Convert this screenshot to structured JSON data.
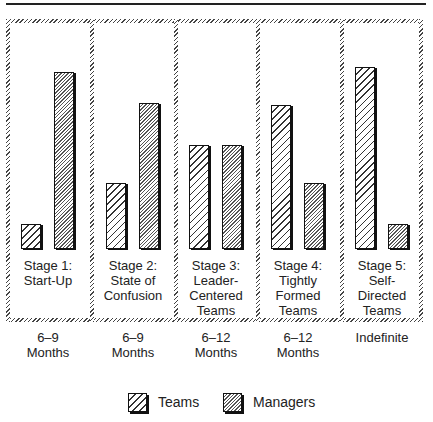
{
  "chart_data": {
    "type": "bar",
    "title": "",
    "xlabel": "",
    "ylabel": "",
    "ylim": [
      0,
      100
    ],
    "grid": false,
    "legend_position": "bottom",
    "categories": [
      "Stage 1: Start-Up",
      "Stage 2: State of Confusion",
      "Stage 3: Leader-Centered Teams",
      "Stage 4: Tightly Formed Teams",
      "Stage 5: Self-Directed Teams"
    ],
    "durations": [
      "6–9 Months",
      "6–9 Months",
      "6–12 Months",
      "6–12 Months",
      "Indefinite"
    ],
    "series": [
      {
        "name": "Teams",
        "values": [
          14,
          36,
          57,
          79,
          100
        ]
      },
      {
        "name": "Managers",
        "values": [
          97,
          80,
          57,
          36,
          14
        ]
      }
    ]
  },
  "stages": [
    {
      "label_lines": [
        "Stage 1:",
        "Start-Up"
      ],
      "duration_lines": [
        "6–9",
        "Months"
      ]
    },
    {
      "label_lines": [
        "Stage 2:",
        "State of",
        "Confusion"
      ],
      "duration_lines": [
        "6–9",
        "Months"
      ]
    },
    {
      "label_lines": [
        "Stage 3:",
        "Leader-",
        "Centered",
        "Teams"
      ],
      "duration_lines": [
        "6–12",
        "Months"
      ]
    },
    {
      "label_lines": [
        "Stage 4:",
        "Tightly",
        "Formed",
        "Teams"
      ],
      "duration_lines": [
        "6–12",
        "Months"
      ]
    },
    {
      "label_lines": [
        "Stage 5:",
        "Self-",
        "Directed",
        "Teams"
      ],
      "duration_lines": [
        "Indefinite"
      ]
    }
  ],
  "legend": {
    "teams_label": "Teams",
    "managers_label": "Managers"
  }
}
